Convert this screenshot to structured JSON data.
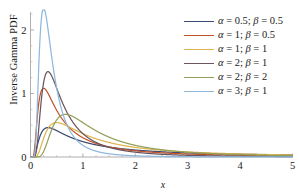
{
  "chart_data": {
    "type": "line",
    "title": "",
    "xlabel": "x",
    "ylabel": "Inverse Gamma PDF",
    "xlim": [
      0,
      5
    ],
    "ylim": [
      0,
      2.45
    ],
    "grid": false,
    "legend_position": "top-right",
    "x_ticks": [
      "0",
      "1",
      "2",
      "3",
      "4",
      "5"
    ],
    "x_tick_values": [
      0,
      1,
      2,
      3,
      4,
      5
    ],
    "y_ticks": [
      "0",
      "1",
      "2"
    ],
    "y_tick_values": [
      0,
      1,
      2
    ],
    "y_minor_tick_values": [
      0.25,
      0.5,
      0.75,
      1.25,
      1.5,
      1.75,
      2.25
    ],
    "series": [
      {
        "name": "alpha = 0.5; beta = 0.5",
        "label": "α = 0.5; β = 0.5",
        "alpha": 0.5,
        "beta": 0.5,
        "color": "#3b4a72",
        "peak_x": 0.333,
        "peak_y": 0.513
      },
      {
        "name": "alpha = 1; beta = 0.5",
        "label": "α = 1; β = 0.5",
        "alpha": 1,
        "beta": 0.5,
        "color": "#c0562c",
        "peak_x": 0.25,
        "peak_y": 1.083
      },
      {
        "name": "alpha = 1; beta = 1",
        "label": "α = 1; β = 1",
        "alpha": 1,
        "beta": 1,
        "color": "#e0b451",
        "peak_x": 0.5,
        "peak_y": 0.541
      },
      {
        "name": "alpha = 2; beta = 1",
        "label": "α = 2; β = 1",
        "alpha": 2,
        "beta": 1,
        "color": "#6b5560",
        "peak_x": 0.333,
        "peak_y": 1.343
      },
      {
        "name": "alpha = 2; beta = 2",
        "label": "α = 2; β = 2",
        "alpha": 2,
        "beta": 2,
        "color": "#93a05a",
        "peak_x": 0.667,
        "peak_y": 0.672
      },
      {
        "name": "alpha = 3; beta = 1",
        "label": "α = 3; β = 1",
        "alpha": 3,
        "beta": 1,
        "color": "#8fb8dd",
        "peak_x": 0.25,
        "peak_y": 2.39
      }
    ]
  }
}
